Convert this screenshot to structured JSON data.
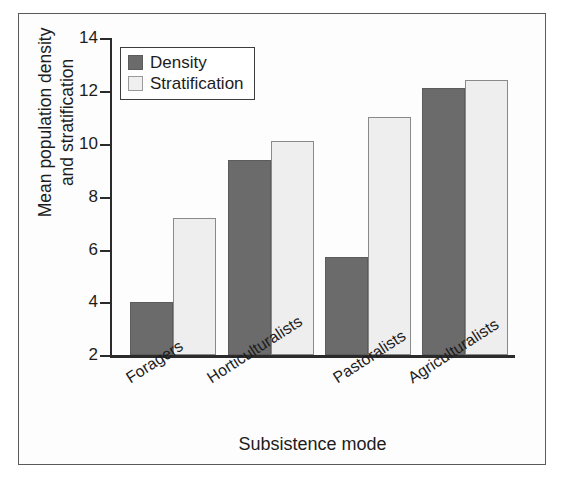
{
  "figure": {
    "caption_remnant": "",
    "frame_color": "#5a5a5a"
  },
  "chart_data": {
    "type": "bar",
    "title": "",
    "xlabel": "Subsistence mode",
    "ylabel": "Mean population density and stratification",
    "ylabel_line1": "Mean population density",
    "ylabel_line2": "and stratification",
    "categories": [
      "Foragers",
      "Horticulturalists",
      "Pastoralists",
      "Agriculturalists"
    ],
    "series": [
      {
        "name": "Density",
        "color": "#6b6b6b",
        "values": [
          4.0,
          9.4,
          5.7,
          12.1
        ]
      },
      {
        "name": "Stratification",
        "color": "#eeeeee",
        "values": [
          7.2,
          10.1,
          11.0,
          12.4
        ]
      }
    ],
    "ylim": [
      2,
      14
    ],
    "yticks": [
      2,
      4,
      6,
      8,
      10,
      12,
      14
    ],
    "ytick_labels": [
      "2",
      "4",
      "6",
      "8",
      "10",
      "12",
      "14"
    ],
    "grid": false,
    "legend_position": "top-left",
    "legend_entries": [
      "Density",
      "Stratification"
    ],
    "xtick_rotation_degrees": -33
  }
}
